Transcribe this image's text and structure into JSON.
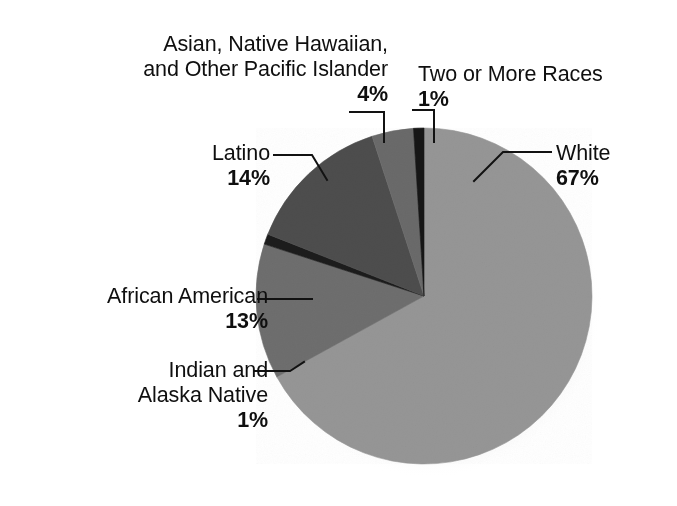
{
  "chart_data": {
    "type": "pie",
    "title": "",
    "subtitle": "",
    "xlabel": "",
    "ylabel": "",
    "legend_position": "none",
    "grid": false,
    "units": "%",
    "start_angle_deg": 0,
    "direction": "clockwise",
    "categories": [
      "White",
      "African American",
      "Indian and Alaska Native",
      "Latino",
      "Asian, Native Hawaiian, and Other Pacific Islander",
      "Two or More Races"
    ],
    "values": [
      67,
      13,
      1,
      14,
      4,
      1
    ],
    "slices": [
      {
        "label": "White",
        "label_lines": [
          "White"
        ],
        "value": 67,
        "value_text": "67%",
        "color": "#969696"
      },
      {
        "label": "African American",
        "label_lines": [
          "African American"
        ],
        "value": 13,
        "value_text": "13%",
        "color": "#6e6e6e"
      },
      {
        "label": "Indian and Alaska Native",
        "label_lines": [
          "Indian and",
          "Alaska Native"
        ],
        "value": 1,
        "value_text": "1%",
        "color": "#1f1f1f"
      },
      {
        "label": "Latino",
        "label_lines": [
          "Latino"
        ],
        "value": 14,
        "value_text": "14%",
        "color": "#4e4e4e"
      },
      {
        "label": "Asian, Native Hawaiian, and Other Pacific Islander",
        "label_lines": [
          "Asian, Native Hawaiian,",
          "and Other Pacific Islander"
        ],
        "value": 4,
        "value_text": "4%",
        "color": "#6b6b6b"
      },
      {
        "label": "Two or More Races",
        "label_lines": [
          "Two or More Races"
        ],
        "value": 1,
        "value_text": "1%",
        "color": "#141414"
      }
    ]
  },
  "labels": {
    "asian": {
      "line1": "Asian, Native Hawaiian,",
      "line2": "and Other Pacific Islander",
      "pct": "4%"
    },
    "two_or_more": {
      "line1": "Two or More Races",
      "pct": "1%"
    },
    "white": {
      "line1": "White",
      "pct": "67%"
    },
    "latino": {
      "line1": "Latino",
      "pct": "14%"
    },
    "african_american": {
      "line1": "African American",
      "pct": "13%"
    },
    "indian_alaska": {
      "line1": "Indian and",
      "line2": "Alaska Native",
      "pct": "1%"
    }
  },
  "colors": {
    "background": "#ffffff",
    "text": "#0f0f0f",
    "leader_line": "#121212",
    "white_slice": "#969696",
    "african_american_slice": "#6e6e6e",
    "indian_alaska_slice": "#1f1f1f",
    "latino_slice": "#4e4e4e",
    "asian_slice": "#6b6b6b",
    "two_or_more_slice": "#141414"
  }
}
